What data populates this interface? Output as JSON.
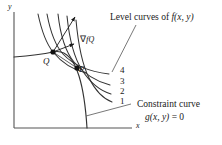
{
  "figure": {
    "axes": {
      "x_label": "x",
      "y_label": "y",
      "x_axis_name": "x-axis",
      "y_axis_name": "y-axis"
    },
    "points": [
      {
        "id": "Q",
        "label": "Q",
        "x": 53,
        "y": 52
      },
      {
        "id": "P",
        "label": "P",
        "x": 77,
        "y": 68
      }
    ],
    "gradient": {
      "label_nabla": "∇",
      "label_f": "f",
      "label_sub": "Q",
      "full_label": "∇f_Q"
    },
    "level_curves": {
      "annotation": "Level curves of ",
      "annotation_fn": "f(x, y)",
      "values": [
        "4",
        "3",
        "2",
        "1"
      ]
    },
    "constraint": {
      "annotation_line1": "Constraint curve",
      "annotation_line2_g": "g(x, y)",
      "annotation_line2_eq": " = 0",
      "annotation_line2": "g(x, y) = 0"
    },
    "colors": {
      "ink": "#1a1a1a",
      "curve": "#333333",
      "axis": "#555555",
      "background": "#ffffff"
    }
  }
}
